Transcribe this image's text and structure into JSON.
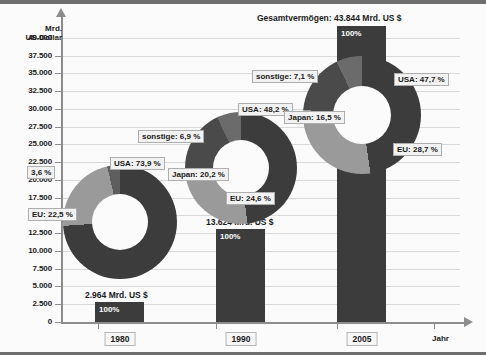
{
  "chart_data": {
    "type": "pie",
    "title": "Gesamtvermögen: 43.844 Mrd. US $",
    "xlabel": "Jahr",
    "ylabel": "Mrd. US-Dollar",
    "ylabel_line1": "Mrd.",
    "ylabel_line2": "US-Dollar",
    "ylim": [
      0,
      42500
    ],
    "yticks": [
      "0",
      "2.500",
      "5.000",
      "7.500",
      "10.000",
      "12.500",
      "15.000",
      "17.500",
      "20.000",
      "22.500",
      "25.000",
      "27.500",
      "30.000",
      "32.500",
      "35.000",
      "37.500",
      "40.000"
    ],
    "ytick_values": [
      0,
      2500,
      5000,
      7500,
      10000,
      12500,
      15000,
      17500,
      20000,
      22500,
      25000,
      27500,
      30000,
      32500,
      35000,
      37500,
      40000
    ],
    "grid": true,
    "legend": "none",
    "categories": [
      "1980",
      "1990",
      "2005"
    ],
    "series": [
      {
        "name": "Gesamtvermögen",
        "values": [
          2964,
          13624,
          43844
        ],
        "value_labels": [
          "2.964 Mrd. US $",
          "13.624 Mrd. US $",
          "43.844 Mrd. US $"
        ],
        "bar_pct": [
          "100%",
          "100%",
          "100%"
        ]
      }
    ],
    "donuts": [
      {
        "year": "1980",
        "total": 2964,
        "total_label": "2.964 Mrd. US $",
        "slices": [
          {
            "name": "USA",
            "value": 73.9,
            "label": "USA: 73,9 %",
            "color": "#3c3c3c"
          },
          {
            "name": "EU",
            "value": 22.5,
            "label": "EU: 22,5 %",
            "color": "#9a9a9a"
          },
          {
            "name": "sonstige",
            "value": 3.6,
            "label": "3,6 %",
            "color": "#5e5e5e"
          }
        ]
      },
      {
        "year": "1990",
        "total": 13624,
        "total_label": "13.624 Mrd. US $",
        "slices": [
          {
            "name": "USA",
            "value": 48.2,
            "label": "USA: 48,2 %",
            "color": "#3c3c3c"
          },
          {
            "name": "EU",
            "value": 24.6,
            "label": "EU: 24,6 %",
            "color": "#9a9a9a"
          },
          {
            "name": "Japan",
            "value": 20.2,
            "label": "Japan: 20,2 %",
            "color": "#4a4a4a"
          },
          {
            "name": "sonstige",
            "value": 6.9,
            "label": "sonstige: 6,9 %",
            "color": "#6b6b6b"
          }
        ]
      },
      {
        "year": "2005",
        "total": 43844,
        "total_label": "43.844 Mrd. US $",
        "slices": [
          {
            "name": "USA",
            "value": 47.7,
            "label": "USA: 47,7 %",
            "color": "#3c3c3c"
          },
          {
            "name": "EU",
            "value": 28.7,
            "label": "EU: 28,7 %",
            "color": "#9a9a9a"
          },
          {
            "name": "Japan",
            "value": 16.5,
            "label": "Japan: 16,5 %",
            "color": "#4a4a4a"
          },
          {
            "name": "sonstige",
            "value": 7.1,
            "label": "sonstige: 7,1 %",
            "color": "#6b6b6b"
          }
        ]
      }
    ],
    "colors": {
      "usa": "#3c3c3c",
      "eu": "#9a9a9a",
      "japan": "#4a4a4a",
      "sonstige": "#6b6b6b",
      "axis": "#8d8d8d",
      "grid": "#d9d9d9",
      "background": "#fbfbfb"
    }
  },
  "axis": {
    "y_title_1": "Mrd.",
    "y_title_2": "US-Dollar",
    "x_title": "Jahr"
  },
  "labels": {
    "cat_1980": "1980",
    "cat_1990": "1990",
    "cat_2005": "2005",
    "total_1980": "2.964 Mrd. US $",
    "total_1990": "13.624 Mrd. US $",
    "total_2005": "Gesamtvermögen:  43.844 Mrd. US $",
    "pct_1980": "100%",
    "pct_1990": "100%",
    "pct_2005": "100%",
    "d1980_usa": "USA: 73,9 %",
    "d1980_eu": "EU: 22,5 %",
    "d1980_sonstige": "3,6 %",
    "d1990_usa": "USA: 48,2 %",
    "d1990_eu": "EU: 24,6 %",
    "d1990_japan": "Japan: 20,2 %",
    "d1990_sonstige": "sonstige: 6,9 %",
    "d2005_usa": "USA: 47,7 %",
    "d2005_eu": "EU: 28,7 %",
    "d2005_japan": "Japan: 16,5 %",
    "d2005_sonstige": "sonstige: 7,1 %"
  },
  "yticks": {
    "t0": "0",
    "t1": "2.500",
    "t2": "5.000",
    "t3": "7.500",
    "t4": "10.000",
    "t5": "12.500",
    "t6": "15.000",
    "t7": "17.500",
    "t8": "20.000",
    "t9": "22.500",
    "t10": "25.000",
    "t11": "27.500",
    "t12": "30.000",
    "t13": "32.500",
    "t14": "35.000",
    "t15": "37.500",
    "t16": "40.000"
  }
}
